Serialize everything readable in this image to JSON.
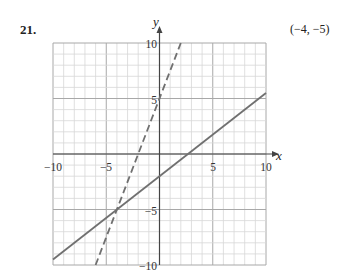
{
  "problem": {
    "number": "21.",
    "answer": "(−4, −5)"
  },
  "colors": {
    "grid_minor": "#d8d8d8",
    "grid_major": "#a8a8a8",
    "axis": "#444444",
    "line": "#707070"
  },
  "chart_data": {
    "type": "line",
    "title": "",
    "xlabel": "x",
    "ylabel": "y",
    "xlim": [
      -10,
      10
    ],
    "ylim": [
      -10,
      10
    ],
    "grid": true,
    "x_ticks": [
      "-10",
      "-5",
      "5",
      "10"
    ],
    "y_ticks": [
      "10",
      "5",
      "-5",
      "-10"
    ],
    "series": [
      {
        "name": "solid line",
        "style": "solid",
        "equation": "y = 0.75x - 2",
        "x": [
          -10,
          10
        ],
        "y": [
          -9.5,
          5.5
        ]
      },
      {
        "name": "dashed line",
        "style": "dashed",
        "equation": "y = 2.5x + 5",
        "x": [
          -6,
          2
        ],
        "y": [
          -10,
          10
        ]
      }
    ],
    "intersection": {
      "x": -4,
      "y": -5,
      "label": "(−4, −5)"
    },
    "legend": "none"
  },
  "labels": {
    "x_axis": "x",
    "y_axis": "y",
    "tick_neg10": "−10",
    "tick_neg5": "−5",
    "tick_5": "5",
    "tick_10": "10",
    "ytick_10": "10",
    "ytick_5": "5",
    "ytick_neg5": "−5",
    "ytick_neg10": "−10"
  }
}
